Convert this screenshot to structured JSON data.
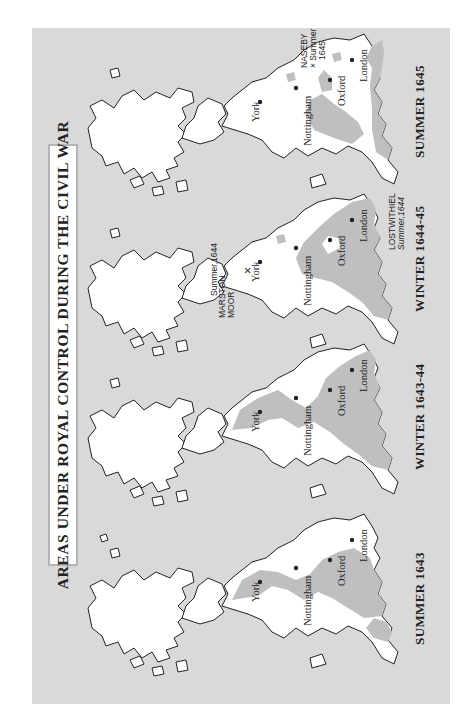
{
  "title": "AREAS UNDER ROYAL CONTROL DURING THE CIVIL WAR",
  "colors": {
    "sea": "#d9d9d9",
    "land": "#ffffff",
    "royal_control": "#bfbfbf",
    "outline": "#222222"
  },
  "orientation": "rotated 90 degrees counterclockwise",
  "maps": [
    {
      "caption": "SUMMER 1643",
      "cities": {
        "york": "York",
        "nottingham": "Nottingham",
        "oxford": "Oxford",
        "london": "London"
      },
      "battles": []
    },
    {
      "caption": "WINTER 1643-44",
      "cities": {
        "york": "York",
        "nottingham": "Nottingham",
        "oxford": "Oxford",
        "london": "London"
      },
      "battles": []
    },
    {
      "caption": "WINTER 1644-45",
      "cities": {
        "york": "York",
        "nottingham": "Nottingham",
        "oxford": "Oxford",
        "london": "London"
      },
      "battles": [
        {
          "name_line1": "MARSTON",
          "name_line2": "MOOR",
          "marker": "×",
          "date": "Summer,1644"
        },
        {
          "name_line1": "LOSTWITHIEL",
          "date": "Summer,1644"
        }
      ]
    },
    {
      "caption": "SUMMER 1645",
      "cities": {
        "york": "York",
        "nottingham": "Nottingham",
        "oxford": "Oxford",
        "london": "London"
      },
      "battles": [
        {
          "name_line1": "NASEBY",
          "marker": "×",
          "date_line1": "Summer",
          "date_line2": "1645"
        }
      ]
    }
  ]
}
